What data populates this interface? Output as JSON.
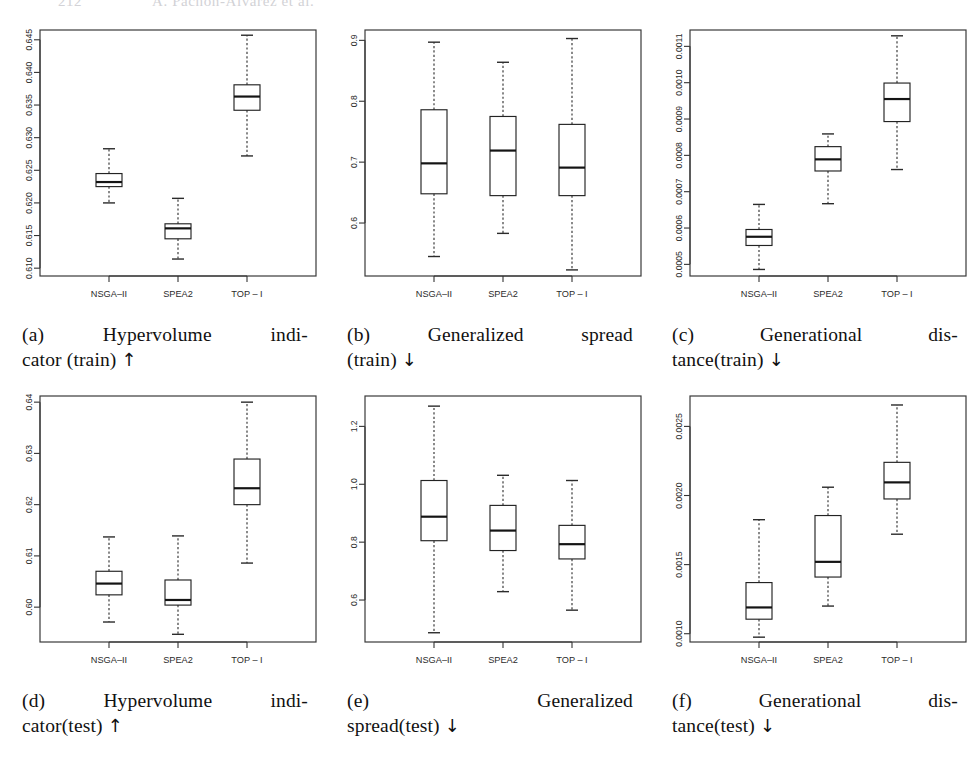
{
  "header": {
    "page_number": "212",
    "running_title": "A. Pachon-Alvarez et al."
  },
  "common": {
    "categories": [
      "NSGA–II",
      "SPEA2",
      "TOP – I"
    ],
    "axis_color": "#333333"
  },
  "figures": [
    {
      "id": "a",
      "label": "(a)",
      "caption_line1": "Hypervolume indi-",
      "caption_line2": "cator (train)",
      "caption_arrow": "↑",
      "caption_full": "(a) Hypervolume indicator (train) ↑",
      "justify_line1": true
    },
    {
      "id": "b",
      "label": "(b)",
      "caption_line1": "Generalized spread",
      "caption_line2": "(train)",
      "caption_arrow": "↓",
      "caption_full": "(b) Generalized spread (train) ↓",
      "justify_line1": true
    },
    {
      "id": "c",
      "label": "(c)",
      "caption_line1": "Generational dis-",
      "caption_line2": "tance(train)",
      "caption_arrow": "↓",
      "caption_full": "(c) Generational distance(train) ↓",
      "justify_line1": true
    },
    {
      "id": "d",
      "label": "(d)",
      "caption_line1": "Hypervolume indi-",
      "caption_line2": "cator(test)",
      "caption_arrow": "↑",
      "caption_full": "(d) Hypervolume indicator(test) ↑",
      "justify_line1": true
    },
    {
      "id": "e",
      "label": "(e)",
      "caption_line1": "Generalized",
      "caption_line2": "spread(test)",
      "caption_arrow": "↓",
      "caption_full": "(e) Generalized spread(test) ↓",
      "justify_line1": true
    },
    {
      "id": "f",
      "label": "(f)",
      "caption_line1": "Generational dis-",
      "caption_line2": "tance(test)",
      "caption_arrow": "↓",
      "caption_full": "(f) Generational distance(test) ↓",
      "justify_line1": true
    }
  ],
  "chart_data": [
    {
      "id": "a",
      "type": "box",
      "title": "Hypervolume indicator (train)",
      "xlabel": "",
      "ylabel": "",
      "categories": [
        "NSGA–II",
        "SPEA2",
        "TOP – I"
      ],
      "yticks": [
        0.61,
        0.615,
        0.62,
        0.625,
        0.63,
        0.635,
        0.64,
        0.645
      ],
      "ytick_labels": [
        "0.610",
        "0.615",
        "0.620",
        "0.625",
        "0.630",
        "0.635",
        "0.640",
        "0.645"
      ],
      "ylim": [
        0.6088,
        0.6465
      ],
      "grid": false,
      "legend": "none",
      "boxes": [
        {
          "category": "NSGA–II",
          "min": 0.62,
          "q1": 0.6225,
          "median": 0.6232,
          "q3": 0.6245,
          "max": 0.6283
        },
        {
          "category": "SPEA2",
          "min": 0.6114,
          "q1": 0.6145,
          "median": 0.6161,
          "q3": 0.6168,
          "max": 0.6207
        },
        {
          "category": "TOP – I",
          "min": 0.6272,
          "q1": 0.6342,
          "median": 0.6363,
          "q3": 0.6381,
          "max": 0.6457
        }
      ]
    },
    {
      "id": "b",
      "type": "box",
      "title": "Generalized spread (train)",
      "xlabel": "",
      "ylabel": "",
      "categories": [
        "NSGA–II",
        "SPEA2",
        "TOP – I"
      ],
      "yticks": [
        0.6,
        0.7,
        0.8,
        0.9
      ],
      "ytick_labels": [
        "0.6",
        "0.7",
        "0.8",
        "0.9"
      ],
      "ylim": [
        0.513,
        0.917
      ],
      "grid": false,
      "legend": "none",
      "boxes": [
        {
          "category": "NSGA–II",
          "min": 0.545,
          "q1": 0.648,
          "median": 0.698,
          "q3": 0.786,
          "max": 0.897
        },
        {
          "category": "SPEA2",
          "min": 0.583,
          "q1": 0.645,
          "median": 0.719,
          "q3": 0.775,
          "max": 0.864
        },
        {
          "category": "TOP – I",
          "min": 0.523,
          "q1": 0.645,
          "median": 0.691,
          "q3": 0.762,
          "max": 0.903
        }
      ]
    },
    {
      "id": "c",
      "type": "box",
      "title": "Generational distance (train)",
      "xlabel": "",
      "ylabel": "",
      "categories": [
        "NSGA–II",
        "SPEA2",
        "TOP – I"
      ],
      "yticks": [
        0.0005,
        0.0006,
        0.0007,
        0.0008,
        0.0009,
        0.001,
        0.0011
      ],
      "ytick_labels": [
        "0.0005",
        "0.0006",
        "0.0007",
        "0.0008",
        "0.0009",
        "0.0010",
        "0.0011"
      ],
      "ylim": [
        0.000468,
        0.001145
      ],
      "grid": false,
      "legend": "none",
      "boxes": [
        {
          "category": "NSGA–II",
          "min": 0.000486,
          "q1": 0.000552,
          "median": 0.000576,
          "q3": 0.000596,
          "max": 0.000665
        },
        {
          "category": "SPEA2",
          "min": 0.000667,
          "q1": 0.000757,
          "median": 0.000789,
          "q3": 0.000824,
          "max": 0.000859
        },
        {
          "category": "TOP – I",
          "min": 0.000761,
          "q1": 0.000893,
          "median": 0.000955,
          "q3": 0.000999,
          "max": 0.001129
        }
      ]
    },
    {
      "id": "d",
      "type": "box",
      "title": "Hypervolume indicator (test)",
      "xlabel": "",
      "ylabel": "",
      "categories": [
        "NSGA–II",
        "SPEA2",
        "TOP – I"
      ],
      "yticks": [
        0.6,
        0.61,
        0.62,
        0.63,
        0.64
      ],
      "ytick_labels": [
        "0.60",
        "0.61",
        "0.62",
        "0.63",
        "0.64"
      ],
      "ylim": [
        0.5932,
        0.6412
      ],
      "grid": false,
      "legend": "none",
      "boxes": [
        {
          "category": "NSGA–II",
          "min": 0.5971,
          "q1": 0.6024,
          "median": 0.6046,
          "q3": 0.607,
          "max": 0.6137
        },
        {
          "category": "SPEA2",
          "min": 0.5947,
          "q1": 0.6004,
          "median": 0.6014,
          "q3": 0.6053,
          "max": 0.6139
        },
        {
          "category": "TOP – I",
          "min": 0.6086,
          "q1": 0.62,
          "median": 0.6232,
          "q3": 0.6289,
          "max": 0.64
        }
      ]
    },
    {
      "id": "e",
      "type": "box",
      "title": "Generalized spread (test)",
      "xlabel": "",
      "ylabel": "",
      "categories": [
        "NSGA–II",
        "SPEA2",
        "TOP – I"
      ],
      "yticks": [
        0.6,
        0.8,
        1.0,
        1.2
      ],
      "ytick_labels": [
        "0.6",
        "0.8",
        "1.0",
        "1.2"
      ],
      "ylim": [
        0.455,
        1.305
      ],
      "grid": false,
      "legend": "none",
      "boxes": [
        {
          "category": "NSGA–II",
          "min": 0.487,
          "q1": 0.805,
          "median": 0.888,
          "q3": 1.013,
          "max": 1.27
        },
        {
          "category": "SPEA2",
          "min": 0.629,
          "q1": 0.771,
          "median": 0.84,
          "q3": 0.927,
          "max": 1.031
        },
        {
          "category": "TOP – I",
          "min": 0.565,
          "q1": 0.742,
          "median": 0.793,
          "q3": 0.858,
          "max": 1.013
        }
      ]
    },
    {
      "id": "f",
      "type": "box",
      "title": "Generational distance (test)",
      "xlabel": "",
      "ylabel": "",
      "categories": [
        "NSGA–II",
        "SPEA2",
        "TOP – I"
      ],
      "yticks": [
        0.001,
        0.0015,
        0.002,
        0.0025
      ],
      "ytick_labels": [
        "0.0010",
        "0.0015",
        "0.0020",
        "0.0025"
      ],
      "ylim": [
        0.00094,
        0.00272
      ],
      "grid": false,
      "legend": "none",
      "boxes": [
        {
          "category": "NSGA–II",
          "min": 0.000975,
          "q1": 0.001105,
          "median": 0.00119,
          "q3": 0.00137,
          "max": 0.001825
        },
        {
          "category": "SPEA2",
          "min": 0.0012,
          "q1": 0.00141,
          "median": 0.00152,
          "q3": 0.001855,
          "max": 0.00206
        },
        {
          "category": "TOP – I",
          "min": 0.00172,
          "q1": 0.001975,
          "median": 0.002095,
          "q3": 0.00224,
          "max": 0.002655
        }
      ]
    }
  ]
}
